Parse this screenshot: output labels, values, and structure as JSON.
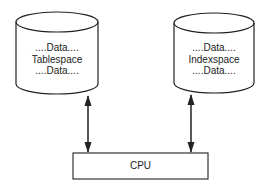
{
  "diagram": {
    "nodes": [
      {
        "id": "tablespace",
        "shape": "cylinder",
        "lines": [
          "....Data....",
          "Tablespace",
          "....Data...."
        ]
      },
      {
        "id": "indexspace",
        "shape": "cylinder",
        "lines": [
          "....Data....",
          "Indexspace",
          "....Data...."
        ]
      },
      {
        "id": "cpu",
        "shape": "rectangle",
        "label": "CPU"
      }
    ],
    "edges": [
      {
        "from": "tablespace",
        "to": "cpu",
        "direction": "bidirectional"
      },
      {
        "from": "indexspace",
        "to": "cpu",
        "direction": "bidirectional"
      }
    ],
    "colors": {
      "stroke": "#222222",
      "background": "#ffffff"
    }
  }
}
